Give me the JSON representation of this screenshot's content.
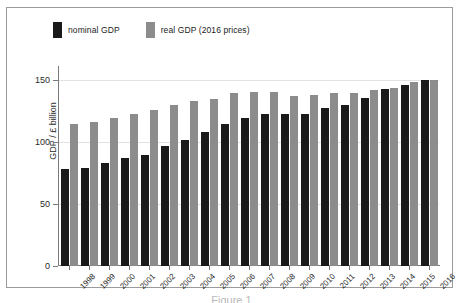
{
  "figure": {
    "caption": "Figure 1"
  },
  "legend": {
    "entries": [
      {
        "label": "nominal GDP",
        "color": "#1a1a1a",
        "key": "nominal"
      },
      {
        "label": "real GDP (2016 prices)",
        "color": "#8c8c8c",
        "key": "real"
      }
    ]
  },
  "axes": {
    "y_title": "GDP / £ billion",
    "y_ticks": [
      "0",
      "50",
      "100",
      "150"
    ],
    "x_title": ""
  },
  "chart_data": {
    "type": "bar",
    "title": "",
    "xlabel": "",
    "ylabel": "GDP / £ billion",
    "ylim": [
      0,
      160
    ],
    "yticks": [
      0,
      50,
      100,
      150
    ],
    "grid": true,
    "legend_position": "top-left",
    "categories": [
      "1998",
      "1999",
      "2000",
      "2001",
      "2002",
      "2003",
      "2004",
      "2005",
      "2006",
      "2007",
      "2008",
      "2009",
      "2010",
      "2011",
      "2012",
      "2013",
      "2014",
      "2015",
      "2016"
    ],
    "series": [
      {
        "name": "nominal GDP",
        "color": "#1a1a1a",
        "values": [
          78,
          79,
          83,
          87,
          90,
          97,
          102,
          108,
          115,
          120,
          123,
          123,
          123,
          128,
          130,
          136,
          143,
          146,
          150
        ]
      },
      {
        "name": "real GDP (2016 prices)",
        "color": "#8c8c8c",
        "values": [
          115,
          116,
          120,
          123,
          126,
          130,
          133,
          135,
          140,
          141,
          141,
          137,
          138,
          140,
          140,
          142,
          144,
          149,
          150
        ]
      }
    ]
  }
}
